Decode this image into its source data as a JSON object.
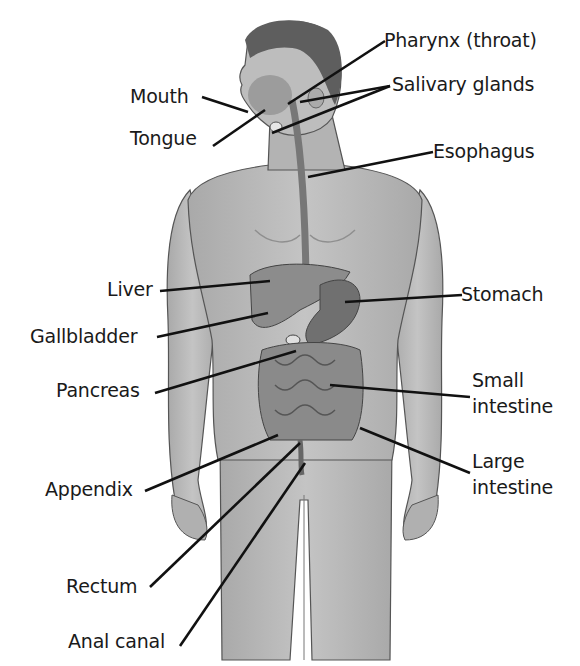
{
  "diagram": {
    "labels_left": [
      {
        "id": "mouth",
        "text": "Mouth",
        "x": 130,
        "y": 86
      },
      {
        "id": "tongue",
        "text": "Tongue",
        "x": 130,
        "y": 128
      },
      {
        "id": "liver",
        "text": "Liver",
        "x": 107,
        "y": 279
      },
      {
        "id": "gallbladder",
        "text": "Gallbladder",
        "x": 30,
        "y": 326
      },
      {
        "id": "pancreas",
        "text": "Pancreas",
        "x": 56,
        "y": 380
      },
      {
        "id": "appendix",
        "text": "Appendix",
        "x": 45,
        "y": 479
      },
      {
        "id": "rectum",
        "text": "Rectum",
        "x": 66,
        "y": 576
      },
      {
        "id": "anal-canal",
        "text": "Anal canal",
        "x": 68,
        "y": 631
      }
    ],
    "labels_right": [
      {
        "id": "pharynx",
        "text": "Pharynx (throat)",
        "x": 384,
        "y": 30
      },
      {
        "id": "salivary-glands",
        "text": "Salivary glands",
        "x": 392,
        "y": 74
      },
      {
        "id": "esophagus",
        "text": "Esophagus",
        "x": 433,
        "y": 141
      },
      {
        "id": "stomach",
        "text": "Stomach",
        "x": 461,
        "y": 284
      },
      {
        "id": "small-intestine-1",
        "text": "Small",
        "x": 472,
        "y": 370
      },
      {
        "id": "small-intestine-2",
        "text": "intestine",
        "x": 472,
        "y": 396
      },
      {
        "id": "large-intestine-1",
        "text": "Large",
        "x": 472,
        "y": 451
      },
      {
        "id": "large-intestine-2",
        "text": "intestine",
        "x": 472,
        "y": 477
      }
    ],
    "colors": {
      "skin": "#b9b9b9",
      "skin_shadow": "#9a9a9a",
      "hair": "#5a5a5a",
      "organ": "#8a8a8a",
      "organ_dark": "#6e6e6e",
      "leader_line": "#111111",
      "text": "#1a1a1a"
    }
  }
}
